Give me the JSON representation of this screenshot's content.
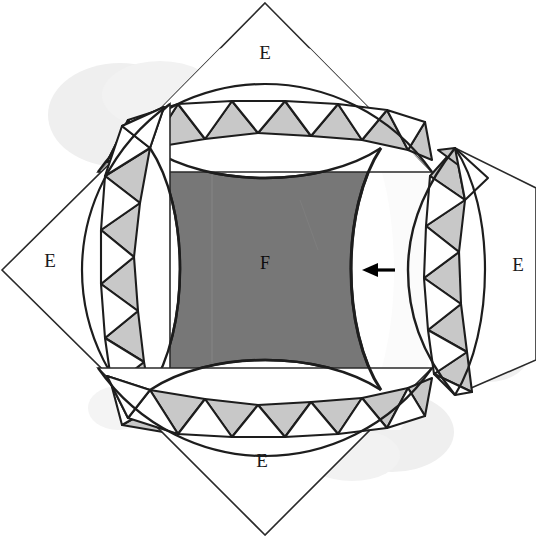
{
  "figure": {
    "background_color": "#ffffff",
    "ink_color": "#1a1a1a",
    "core_fill": "#777777",
    "triangle_gray_fill": "#c8c8c8",
    "triangle_white_fill": "#ffffff",
    "shadow_color": "#ebebeb",
    "labels": {
      "core": "F",
      "corner_top": "E",
      "corner_left": "E",
      "corner_bottom": "E",
      "corner_right": "E"
    },
    "annotations": {
      "arrow": "←",
      "arrow_name": "gap-pointer-arrow"
    },
    "geometry": {
      "outer_diamond_vertices": [
        [
          265,
          3
        ],
        [
          448,
          188
        ],
        [
          448,
          420
        ],
        [
          265,
          535
        ],
        [
          2,
          270
        ]
      ],
      "diamond_top_vertex": [
        265,
        3
      ],
      "diamond_left_vertex": [
        2,
        270
      ],
      "diamond_bottom_vertex": [
        265,
        535
      ],
      "core_center": [
        265,
        268
      ],
      "detached_piece_top_vertex": [
        455,
        148
      ],
      "detached_piece_bottom_vertex": [
        455,
        395
      ],
      "detached_offset_px": 60,
      "band_triangle_count_per_side": 18
    }
  }
}
